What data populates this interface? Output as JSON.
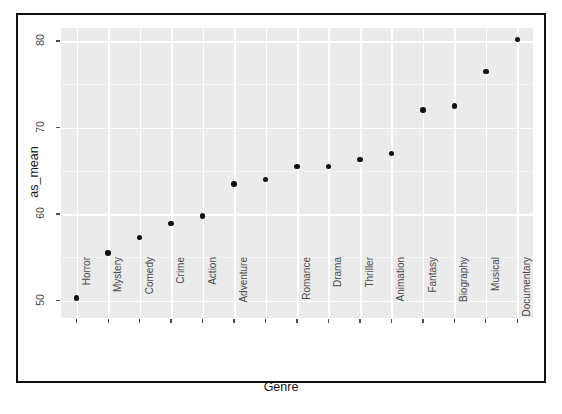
{
  "chart_data": {
    "type": "scatter",
    "title": "",
    "xlabel": "Genre",
    "ylabel": "as_mean",
    "ylim": [
      48,
      81.5
    ],
    "yticks": [
      50,
      60,
      70,
      80
    ],
    "ytick_labels": [
      "50",
      "60",
      "70",
      "80"
    ],
    "grid": true,
    "legend": "none",
    "categories": [
      "Horror",
      "Mystery",
      "Comedy",
      "Crime",
      "Action",
      "Adventure",
      "",
      "Romance",
      "Drama",
      "Thriller",
      "Animation",
      "Fantasy",
      "Biography",
      "Musical",
      "Documentary"
    ],
    "values": [
      50.3,
      55.5,
      57.3,
      58.9,
      59.8,
      63.5,
      64.0,
      65.5,
      65.5,
      66.3,
      67.0,
      72.0,
      72.5,
      76.5,
      80.2
    ],
    "point_color": "#111111",
    "panel_color": "#ebebeb",
    "gridline_color": "#ffffff"
  }
}
